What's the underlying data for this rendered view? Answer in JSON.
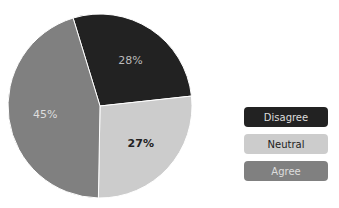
{
  "chart_data": {
    "type": "pie",
    "title": "",
    "categories": [
      "Disagree",
      "Neutral",
      "Agree"
    ],
    "values": [
      28,
      27,
      45
    ],
    "labels": [
      "28%",
      "27%",
      "45%"
    ],
    "colors": [
      "#222222",
      "#cccccc",
      "#808080"
    ],
    "label_colors": [
      "#bbbbbb",
      "#222222",
      "#dddddd"
    ],
    "legend_position": "right"
  },
  "legend": {
    "items": [
      {
        "label": "Disagree",
        "color": "#222222",
        "text_color": "#dddddd"
      },
      {
        "label": "Neutral",
        "color": "#cccccc",
        "text_color": "#222222"
      },
      {
        "label": "Agree",
        "color": "#808080",
        "text_color": "#dddddd"
      }
    ]
  }
}
